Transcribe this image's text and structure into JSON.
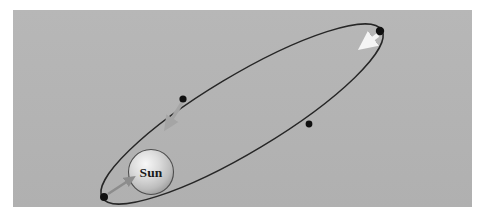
{
  "figure": {
    "kind": "astronomy-diagram",
    "canvas": {
      "width": 486,
      "height": 220
    },
    "page_background_color": "#ffffff"
  },
  "panel": {
    "name": "illustration-panel",
    "background_color": "#b4b4b4",
    "x": 13,
    "y": 10,
    "width": 459,
    "height": 197
  },
  "orbit": {
    "label": "orbit-ellipse",
    "stroke_color": "#262626",
    "stroke_width": 1.4,
    "fill": "none",
    "center_x": 242,
    "center_y": 114,
    "semi_major": 163,
    "semi_minor": 38,
    "rotation_deg": -31
  },
  "sun": {
    "label": "Sun",
    "center_x": 151,
    "center_y": 172,
    "radius": 22.5,
    "fill_light": "#f2f2f2",
    "fill_mid": "#cfcfcf",
    "fill_dark": "#9a9a9a",
    "outline_color": "#4d4d4d",
    "text_color": "#1a1a1a"
  },
  "orbit_points": [
    {
      "name": "perihelion-point",
      "x": 104,
      "y": 197,
      "radius": 4.0,
      "color": "#101010"
    },
    {
      "name": "orbit-point-upper-left",
      "x": 183,
      "y": 99,
      "radius": 3.6,
      "color": "#101010"
    },
    {
      "name": "orbit-point-lower-right",
      "x": 309,
      "y": 124,
      "radius": 3.4,
      "color": "#101010"
    },
    {
      "name": "aphelion-point",
      "x": 380,
      "y": 31,
      "radius": 4.2,
      "color": "#101010"
    }
  ],
  "arrows": [
    {
      "name": "arrow-perihelion-to-sun",
      "color": "#8c8c8c",
      "x1": 108,
      "y1": 194,
      "x2": 133,
      "y2": 178,
      "width": 4.5
    },
    {
      "name": "arrow-velocity-upper-left",
      "color": "#a5a5a5",
      "x1": 182,
      "y1": 103,
      "x2": 167,
      "y2": 126,
      "width": 6.0
    },
    {
      "name": "arrow-velocity-aphelion",
      "color": "#f5f5f5",
      "x1": 378,
      "y1": 35,
      "x2": 364,
      "y2": 45,
      "width": 8.0
    }
  ]
}
